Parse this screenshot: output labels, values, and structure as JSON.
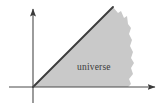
{
  "figure": {
    "background_color": "#ffffff",
    "axis_color": "#4a4a4a",
    "boundary_line_color": "#3d3d3d",
    "region_fill_color": "#c9c9c9",
    "label_color": "#3a3a3a"
  },
  "labels": {
    "region": "universe"
  },
  "axes": {
    "origin": {
      "x": 33,
      "y": 87
    },
    "horizontal": {
      "name": "horizontal-axis",
      "start_x": 9,
      "end_x": 157,
      "y": 87,
      "arrow": "right"
    },
    "vertical": {
      "name": "vertical-axis",
      "x": 33,
      "start_y": 103,
      "end_y": 6,
      "arrow": "up"
    }
  },
  "boundary_line": {
    "name": "wedge-boundary-line",
    "from": {
      "x": 33,
      "y": 87
    },
    "to": {
      "x": 113,
      "y": 7
    }
  },
  "region": {
    "name": "universe-region",
    "description": "shaded wedge below the diagonal, ragged right edge",
    "label_position": {
      "x": 77,
      "y": 70
    },
    "ragged_edge_points": "113,7 118,13 121,11 124,18 127,16 128,24 131,28 129,34 132,40 130,46 133,52 131,58 134,63 131,68 133,74 129,79 131,84 128,87"
  }
}
